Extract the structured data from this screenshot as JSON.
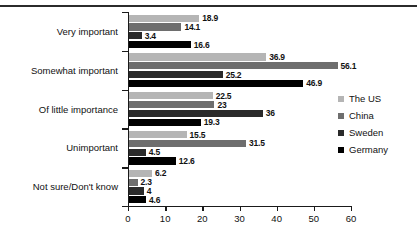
{
  "chart_data": {
    "type": "bar",
    "orientation": "horizontal",
    "title": "",
    "subtitle": "",
    "xlabel": "",
    "ylabel": "",
    "xlim": [
      0,
      60
    ],
    "xticks": [
      0,
      10,
      20,
      30,
      40,
      50,
      60
    ],
    "xtick_labels": [
      "0",
      "10",
      "20",
      "30",
      "40",
      "50",
      "60"
    ],
    "grid": false,
    "legend_position": "right",
    "categories": [
      "Very important",
      "Somewhat important",
      "Of little importance",
      "Unimportant",
      "Not sure/Don't know"
    ],
    "series": [
      {
        "name": "The US",
        "color": "#b5b5b5",
        "values": [
          18.9,
          36.9,
          22.5,
          15.5,
          6.2
        ],
        "labels": [
          "18.9",
          "36.9",
          "22.5",
          "15.5",
          "6.2"
        ]
      },
      {
        "name": "China",
        "color": "#6e6e6e",
        "values": [
          14.1,
          56.1,
          23,
          31.5,
          2.3
        ],
        "labels": [
          "14.1",
          "56.1",
          "23",
          "31.5",
          "2.3"
        ]
      },
      {
        "name": "Sweden",
        "color": "#2a2a2a",
        "values": [
          3.4,
          25.2,
          36,
          4.5,
          4
        ],
        "labels": [
          "3.4",
          "25.2",
          "36",
          "4.5",
          "4"
        ]
      },
      {
        "name": "Germany",
        "color": "#000000",
        "values": [
          16.6,
          46.9,
          19.3,
          12.6,
          4.6
        ],
        "labels": [
          "16.6",
          "46.9",
          "19.3",
          "12.6",
          "4.6"
        ]
      }
    ]
  },
  "legend": {
    "items": [
      {
        "label": "The US",
        "color": "#b5b5b5"
      },
      {
        "label": "China",
        "color": "#6e6e6e"
      },
      {
        "label": "Sweden",
        "color": "#2a2a2a"
      },
      {
        "label": "Germany",
        "color": "#000000"
      }
    ]
  }
}
